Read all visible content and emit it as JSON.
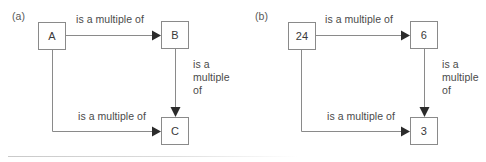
{
  "figure": {
    "background_color": "#ffffff",
    "line_color": "#8a8a8a",
    "arrow_color": "#2b2b2b",
    "text_color": "#4a4a4a"
  },
  "panels": [
    {
      "id": "a",
      "label": "(a)",
      "nodes": {
        "top_left": "A",
        "top_right": "B",
        "bottom_right": "C"
      },
      "edges": {
        "top": "is a multiple of",
        "right_line1": "is a",
        "right_line2": "multiple",
        "right_line3": "of",
        "bottom": "is a multiple of"
      }
    },
    {
      "id": "b",
      "label": "(b)",
      "nodes": {
        "top_left": "24",
        "top_right": "6",
        "bottom_right": "3"
      },
      "edges": {
        "top": "is a multiple of",
        "right_line1": "is a",
        "right_line2": "multiple",
        "right_line3": "of",
        "bottom": "is a multiple of"
      }
    }
  ]
}
